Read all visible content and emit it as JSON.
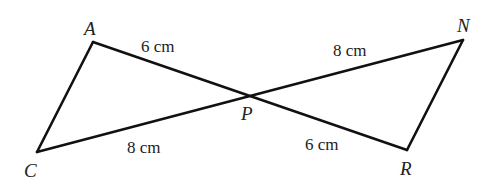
{
  "diagram": {
    "type": "two triangles sharing vertex P (vertically opposite angles)",
    "vertices": {
      "A": {
        "label": "A",
        "x": 93,
        "y": 42
      },
      "C": {
        "label": "C",
        "x": 37,
        "y": 152
      },
      "P": {
        "label": "P",
        "x": 249,
        "y": 96
      },
      "N": {
        "label": "N",
        "x": 463,
        "y": 40
      },
      "R": {
        "label": "R",
        "x": 407,
        "y": 150
      }
    },
    "segments": [
      {
        "from": "A",
        "to": "P",
        "length": "6 cm"
      },
      {
        "from": "C",
        "to": "P",
        "length": "8 cm"
      },
      {
        "from": "P",
        "to": "N",
        "length": "8 cm"
      },
      {
        "from": "P",
        "to": "R",
        "length": "6 cm"
      },
      {
        "from": "A",
        "to": "C",
        "length": ""
      },
      {
        "from": "N",
        "to": "R",
        "length": ""
      }
    ],
    "labels": {
      "A": "A",
      "C": "C",
      "P": "P",
      "N": "N",
      "R": "R",
      "AP": "6 cm",
      "CP": "8 cm",
      "PN": "8 cm",
      "PR": "6 cm"
    }
  }
}
